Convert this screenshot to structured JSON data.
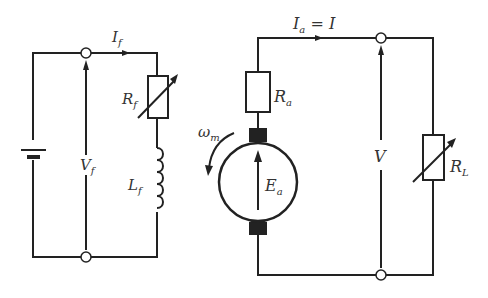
{
  "diagram": {
    "type": "circuit",
    "field_circuit": {
      "current_label": {
        "main": "I",
        "sub": "f"
      },
      "voltage_label": {
        "main": "V",
        "sub": "f"
      },
      "resistor_label": {
        "main": "R",
        "sub": "f"
      },
      "inductor_label": {
        "main": "L",
        "sub": "f"
      },
      "source": "battery"
    },
    "armature_circuit": {
      "current_label": {
        "main": "I",
        "sub": "a",
        "rest": " = I"
      },
      "resistor_label": {
        "main": "R",
        "sub": "a"
      },
      "emf_label": {
        "main": "E",
        "sub": "a"
      },
      "speed_label": {
        "main": "ω",
        "sub": "m"
      },
      "voltage_label": {
        "main": "V",
        "sub": ""
      },
      "load_label": {
        "main": "R",
        "sub": "L"
      }
    }
  }
}
